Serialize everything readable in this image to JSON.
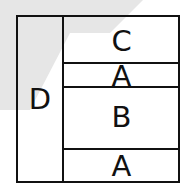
{
  "diagram": {
    "left_cell": {
      "label": "D"
    },
    "right_cells": [
      {
        "label": "C"
      },
      {
        "label": "A"
      },
      {
        "label": "B"
      },
      {
        "label": "A"
      }
    ]
  },
  "colors": {
    "line": "#111111",
    "background_shape": "#e6e6e6",
    "background": "#ffffff"
  }
}
